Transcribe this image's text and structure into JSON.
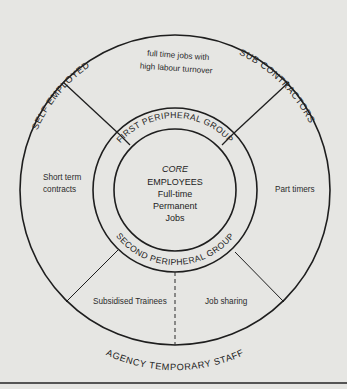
{
  "diagram": {
    "type": "concentric-ring-diagram",
    "core": {
      "title": "CORE",
      "lines": [
        "EMPLOYEES",
        "Full-time",
        "Permanent",
        "Jobs"
      ]
    },
    "rings": {
      "first_peripheral": "FIRST PERIPHERAL GROUP",
      "second_peripheral": "SECOND PERIPHERAL GROUP"
    },
    "outer_labels": {
      "top_left": "SELF EMPLOYED",
      "top_right": "SUB CONTRACTORS",
      "bottom": "AGENCY TEMPORARY STAFF"
    },
    "regions": {
      "top": [
        "full time jobs with",
        "high labour turnover"
      ],
      "left": [
        "Short term",
        "contracts"
      ],
      "right": [
        "Part timers"
      ],
      "bottom_left": [
        "Subsidised Trainees"
      ],
      "bottom_right": [
        "Job sharing"
      ]
    }
  }
}
